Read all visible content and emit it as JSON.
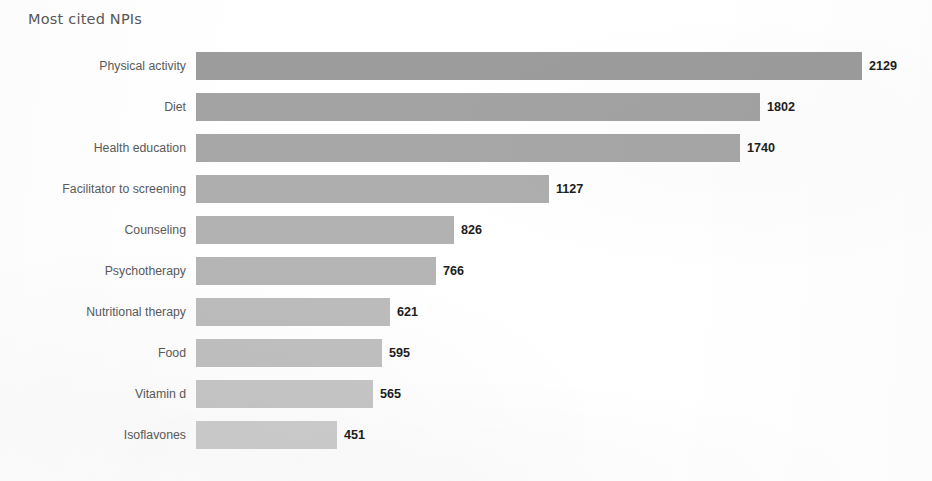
{
  "chart_data": {
    "type": "bar",
    "orientation": "horizontal",
    "title": "Most cited NPIs",
    "xlabel": "",
    "ylabel": "",
    "grid": false,
    "legend": false,
    "value_labels": true,
    "xlim": [
      0,
      2129
    ],
    "categories": [
      "Physical activity",
      "Diet",
      "Health education",
      "Facilitator to screening",
      "Counseling",
      "Psychotherapy",
      "Nutritional therapy",
      "Food",
      "Vitamin d",
      "Isoflavones"
    ],
    "values": [
      2129,
      1802,
      1740,
      1127,
      826,
      766,
      621,
      595,
      565,
      451
    ],
    "bar_colors": [
      "#9c9c9c",
      "#a3a3a3",
      "#a7a7a7",
      "#aeaeae",
      "#b2b2b2",
      "#b5b5b5",
      "#bcbcbc",
      "#c0c0c0",
      "#c6c6c6",
      "#cdcdcd"
    ],
    "bars": [
      {
        "label": "Physical activity",
        "value": 2129,
        "value_text": "2129",
        "color": "#9c9c9c"
      },
      {
        "label": "Diet",
        "value": 1802,
        "value_text": "1802",
        "color": "#a3a3a3"
      },
      {
        "label": "Health education",
        "value": 1740,
        "value_text": "1740",
        "color": "#a7a7a7"
      },
      {
        "label": "Facilitator to screening",
        "value": 1127,
        "value_text": "1127",
        "color": "#aeaeae"
      },
      {
        "label": "Counseling",
        "value": 826,
        "value_text": "826",
        "color": "#b2b2b2"
      },
      {
        "label": "Psychotherapy",
        "value": 766,
        "value_text": "766",
        "color": "#b5b5b5"
      },
      {
        "label": "Nutritional therapy",
        "value": 621,
        "value_text": "621",
        "color": "#bcbcbc"
      },
      {
        "label": "Food",
        "value": 595,
        "value_text": "595",
        "color": "#c0c0c0"
      },
      {
        "label": "Vitamin d",
        "value": 565,
        "value_text": "565",
        "color": "#c6c6c6"
      },
      {
        "label": "Isoflavones",
        "value": 451,
        "value_text": "451",
        "color": "#cdcdcd"
      }
    ]
  },
  "style": {
    "background": "#ffffff",
    "title_color": "#58595b",
    "category_label_color": "#5a5a5a",
    "value_label_color": "#1d1d1d",
    "max_bar_pixels": 666,
    "bar_height_px": 28,
    "row_pitch_px": 41,
    "bar_origin_x_px": 196,
    "value_gap_px": 7
  }
}
